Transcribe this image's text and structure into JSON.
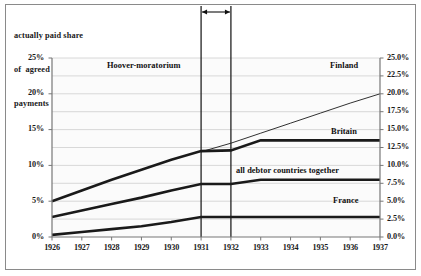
{
  "chart_data": {
    "type": "line",
    "title": "actually paid share of agreed debt payments",
    "title_lines": [
      "actually paid share",
      "of  agreed debt",
      "payments"
    ],
    "xlabel": "",
    "ylabel": "",
    "x": [
      1926,
      1927,
      1928,
      1929,
      1930,
      1931,
      1932,
      1933,
      1934,
      1935,
      1936,
      1937
    ],
    "xtick_labels": [
      "1926",
      "1927",
      "1928",
      "1929",
      "1930",
      "1931",
      "1932",
      "1933",
      "1934",
      "1935",
      "1936",
      "1937"
    ],
    "ylim": [
      0,
      25
    ],
    "ytick_labels_left": [
      "25%",
      "20%",
      "15%",
      "10%",
      "5%",
      "0%"
    ],
    "ytick_values_left": [
      25,
      20,
      15,
      10,
      5,
      0
    ],
    "ytick_labels_right": [
      "25.0%",
      "22.5%",
      "20.0%",
      "17.5%",
      "15.0%",
      "12.5%",
      "10.0%",
      "7.5%",
      "5.0%",
      "2.5%",
      "0.0%"
    ],
    "ytick_values_right": [
      25,
      22.5,
      20,
      17.5,
      15,
      12.5,
      10,
      7.5,
      5,
      2.5,
      0
    ],
    "grid": true,
    "grid_color": "#c9c9c9",
    "legend_position": "inline-right",
    "series": [
      {
        "name": "Finland",
        "style": "thin",
        "color": "#1a1a1a",
        "x": [
          1931,
          1932,
          1933,
          1934,
          1935,
          1936,
          1937
        ],
        "values": [
          11.9,
          13.1,
          14.5,
          15.9,
          17.3,
          18.7,
          20.0
        ]
      },
      {
        "name": "Britain",
        "style": "thick",
        "color": "#1a1a1a",
        "x": [
          1926,
          1927,
          1928,
          1929,
          1930,
          1931,
          1932,
          1933,
          1934,
          1935,
          1936,
          1937
        ],
        "values": [
          5.0,
          6.5,
          8.0,
          9.4,
          10.8,
          12.0,
          12.1,
          13.5,
          13.5,
          13.5,
          13.5,
          13.5
        ]
      },
      {
        "name": "all debtor countries together",
        "style": "thick",
        "color": "#1a1a1a",
        "x": [
          1926,
          1927,
          1928,
          1929,
          1930,
          1931,
          1932,
          1933,
          1934,
          1935,
          1936,
          1937
        ],
        "values": [
          2.8,
          3.7,
          4.6,
          5.5,
          6.5,
          7.4,
          7.4,
          8.0,
          8.0,
          8.0,
          8.0,
          8.0
        ]
      },
      {
        "name": "France",
        "style": "thick",
        "color": "#1a1a1a",
        "x": [
          1926,
          1927,
          1928,
          1929,
          1930,
          1931,
          1932,
          1933,
          1934,
          1935,
          1936,
          1937
        ],
        "values": [
          0.3,
          0.7,
          1.1,
          1.5,
          2.1,
          2.8,
          2.8,
          2.8,
          2.8,
          2.8,
          2.8,
          2.8
        ]
      }
    ],
    "annotations": [
      {
        "name": "Hoover-moratorium",
        "label": "Hoover-moratorium",
        "from_x": 1931,
        "to_x": 1932,
        "type": "span-arrow"
      }
    ]
  },
  "axis": {
    "left_ticks": [
      "25%",
      "20%",
      "15%",
      "10%",
      "5%",
      "0%"
    ],
    "right_ticks": [
      "25.0%",
      "22.5%",
      "20.0%",
      "17.5%",
      "15.0%",
      "12.5%",
      "10.0%",
      "7.5%",
      "5.0%",
      "2.5%",
      "0.0%"
    ],
    "x_ticks": [
      "1926",
      "1927",
      "1928",
      "1929",
      "1930",
      "1931",
      "1932",
      "1933",
      "1934",
      "1935",
      "1936",
      "1937"
    ]
  },
  "labels": {
    "finland": "Finland",
    "britain": "Britain",
    "all_debtor": "all debtor countries together",
    "france": "France",
    "hoover": "Hoover-moratorium"
  },
  "colors": {
    "line": "#1a1a1a",
    "grid": "#c9c9c9",
    "axis": "#777777",
    "border": "#8a8a8a",
    "plot_bg": "#fbfbfb"
  }
}
